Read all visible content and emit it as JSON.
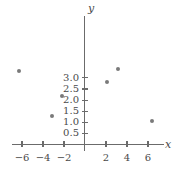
{
  "chart_data": {
    "type": "scatter",
    "title": "",
    "xlabel": "x",
    "ylabel": "y",
    "grid": false,
    "legend": "none",
    "xlim": [
      -7.5,
      7.5
    ],
    "ylim": [
      0,
      3.7
    ],
    "xticks": [
      -6,
      -4,
      -2,
      2,
      4,
      6
    ],
    "xtick_labels": [
      "−6",
      "−4",
      "−2",
      "2",
      "4",
      "6"
    ],
    "yticks": [
      0.5,
      1.0,
      1.5,
      2.0,
      2.5,
      3.0
    ],
    "ytick_labels": [
      "0.5",
      "1.0",
      "1.5",
      "2.0",
      "2.5",
      "3.0"
    ],
    "points": [
      {
        "x": -6.3,
        "y": 3.3
      },
      {
        "x": -3.1,
        "y": 1.3
      },
      {
        "x": -2.2,
        "y": 2.2
      },
      {
        "x": 2.1,
        "y": 2.8
      },
      {
        "x": 3.1,
        "y": 3.4
      },
      {
        "x": 6.4,
        "y": 1.05
      }
    ],
    "marker_color": "#7a7a7a",
    "axis_color": "#6b6b6b",
    "text_color": "#4a4a4a",
    "background": "#ffffff"
  }
}
